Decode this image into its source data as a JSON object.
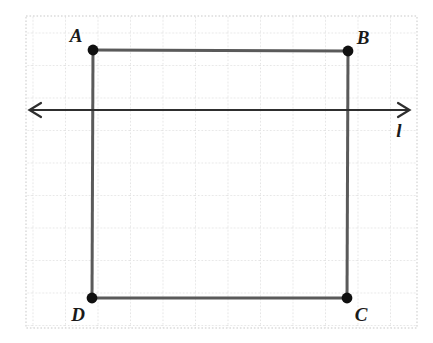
{
  "figure": {
    "type": "geometry-diagram",
    "canvas": {
      "width": 433,
      "height": 343,
      "background": "#ffffff"
    },
    "grid": {
      "visible": true,
      "style": "dotted",
      "color": "#c9c9c9",
      "cell_size": 32.5,
      "left": 26,
      "top": 16,
      "right": 417,
      "bottom": 328
    },
    "colors": {
      "segment": "#5a5a5a",
      "line": "#2e2e2e",
      "vertex": "#101010",
      "label": "#1a1a1a",
      "grid": "#c9c9c9"
    },
    "vertices": [
      {
        "name": "A",
        "x": 93,
        "y": 50,
        "label": "A",
        "label_x": 76,
        "label_y": 35
      },
      {
        "name": "B",
        "x": 348,
        "y": 51,
        "label": "B",
        "label_x": 363,
        "label_y": 37
      },
      {
        "name": "C",
        "x": 347,
        "y": 298,
        "label": "C",
        "label_x": 361,
        "label_y": 314
      },
      {
        "name": "D",
        "x": 92,
        "y": 298,
        "label": "D",
        "label_x": 78,
        "label_y": 314
      }
    ],
    "segments": [
      {
        "name": "AB",
        "from": "A",
        "to": "B"
      },
      {
        "name": "BC",
        "from": "B",
        "to": "C"
      },
      {
        "name": "CD",
        "from": "C",
        "to": "D"
      },
      {
        "name": "DA",
        "from": "D",
        "to": "A"
      }
    ],
    "line": {
      "name": "l",
      "label": "l",
      "label_x": 399,
      "label_y": 130,
      "y": 110,
      "x_start": 30,
      "x_end": 409,
      "arrow_left": true,
      "arrow_right": true
    }
  }
}
